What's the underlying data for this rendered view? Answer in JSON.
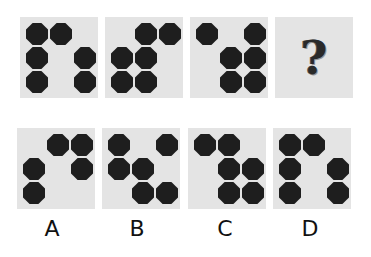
{
  "puzzle": {
    "grid": {
      "rows": 3,
      "cols": 3
    },
    "question_mark": "?",
    "sequence": [
      {
        "id": "panel-1",
        "cells": [
          [
            1,
            1,
            0
          ],
          [
            1,
            0,
            1
          ],
          [
            1,
            0,
            1
          ]
        ]
      },
      {
        "id": "panel-2",
        "cells": [
          [
            0,
            1,
            1
          ],
          [
            1,
            1,
            0
          ],
          [
            1,
            1,
            0
          ]
        ]
      },
      {
        "id": "panel-3",
        "cells": [
          [
            1,
            0,
            1
          ],
          [
            0,
            1,
            1
          ],
          [
            0,
            1,
            1
          ]
        ]
      },
      {
        "id": "panel-4",
        "unknown": true
      }
    ],
    "options": [
      {
        "label": "A",
        "cells": [
          [
            0,
            1,
            1
          ],
          [
            1,
            0,
            1
          ],
          [
            1,
            0,
            0
          ]
        ]
      },
      {
        "label": "B",
        "cells": [
          [
            1,
            0,
            1
          ],
          [
            1,
            1,
            0
          ],
          [
            0,
            1,
            1
          ]
        ]
      },
      {
        "label": "C",
        "cells": [
          [
            1,
            1,
            0
          ],
          [
            0,
            1,
            1
          ],
          [
            0,
            1,
            1
          ]
        ]
      },
      {
        "label": "D",
        "cells": [
          [
            1,
            1,
            0
          ],
          [
            1,
            0,
            1
          ],
          [
            1,
            0,
            1
          ]
        ]
      }
    ]
  },
  "colors": {
    "panel_bg": "#e4e4e4",
    "dot": "#1e1e1e",
    "page_bg": "#ffffff"
  }
}
